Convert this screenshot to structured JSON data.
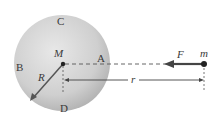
{
  "diagram": {
    "sphere": {
      "mass_label": "M",
      "radius_label": "R",
      "points": {
        "A": "A",
        "B": "B",
        "C": "C",
        "D": "D"
      },
      "fill_light": "#e6e6e6",
      "fill_dark": "#b4b4b4"
    },
    "point_mass": {
      "label": "m",
      "color": "#333333"
    },
    "force": {
      "label": "F",
      "color": "#444444"
    },
    "distance": {
      "label": "r"
    }
  }
}
